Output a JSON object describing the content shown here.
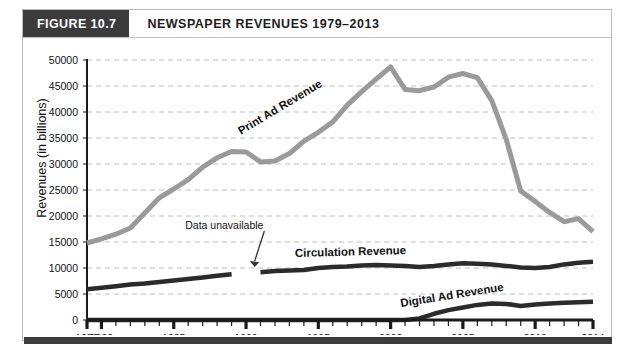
{
  "figure": {
    "tag": "FIGURE 10.7",
    "title": "NEWSPAPER REVENUES 1979–2013"
  },
  "axes": {
    "y_title": "Revenues (in billions)",
    "y_ticks": [
      "0",
      "5000",
      "10000",
      "15000",
      "20000",
      "25000",
      "30000",
      "35000",
      "40000",
      "45000",
      "50000"
    ],
    "x_ticks": [
      "1979",
      "1980",
      "1985",
      "1990",
      "1995",
      "2000",
      "2005",
      "2010",
      "2014"
    ]
  },
  "annotations": {
    "data_unavailable": "Data unavailable"
  },
  "series_labels": {
    "print": "Print Ad Revenue",
    "circulation": "Circulation Revenue",
    "digital": "Digital Ad Revenue"
  },
  "colors": {
    "print": "#9a9a9a",
    "circulation": "#2b2b2b",
    "digital": "#2b2b2b",
    "grid": "#c0c0c0",
    "axis": "#1a1a1a",
    "header_tag_bg": "#3b3b3b",
    "frame": "#b9b9b9"
  },
  "chart_data": {
    "type": "line",
    "title": "NEWSPAPER REVENUES 1979–2013",
    "xlabel": "",
    "ylabel": "Revenues (in billions)",
    "xlim": [
      1979,
      2014
    ],
    "ylim": [
      0,
      50000
    ],
    "grid": true,
    "legend": "inline-labels",
    "x": [
      1979,
      1980,
      1981,
      1982,
      1983,
      1984,
      1985,
      1986,
      1987,
      1988,
      1989,
      1990,
      1991,
      1992,
      1993,
      1994,
      1995,
      1996,
      1997,
      1998,
      1999,
      2000,
      2001,
      2002,
      2003,
      2004,
      2005,
      2006,
      2007,
      2008,
      2009,
      2010,
      2011,
      2012,
      2013,
      2014
    ],
    "series": [
      {
        "name": "Print Ad Revenue",
        "color": "#9a9a9a",
        "values": [
          14800,
          15600,
          16500,
          17700,
          20600,
          23500,
          25200,
          27000,
          29400,
          31200,
          32400,
          32300,
          30400,
          30600,
          32000,
          34400,
          36100,
          38100,
          41300,
          43900,
          46300,
          48700,
          44300,
          44100,
          44800,
          46700,
          47400,
          46600,
          42200,
          34700,
          24800,
          22800,
          20700,
          18900,
          19500,
          17000
        ]
      },
      {
        "name": "Circulation Revenue",
        "color": "#2b2b2b",
        "gap": [
          1990,
          1991
        ],
        "values": [
          5900,
          6200,
          6500,
          6800,
          7000,
          7300,
          7600,
          7900,
          8200,
          8500,
          8800,
          null,
          9200,
          9400,
          9500,
          9600,
          10000,
          10200,
          10300,
          10500,
          10600,
          10500,
          10400,
          10200,
          10400,
          10700,
          10900,
          10800,
          10700,
          10400,
          10100,
          10000,
          10200,
          10700,
          11000,
          11200
        ]
      },
      {
        "name": "Digital Ad Revenue",
        "color": "#2b2b2b",
        "values": [
          0,
          0,
          0,
          0,
          0,
          0,
          0,
          0,
          0,
          0,
          0,
          0,
          0,
          0,
          0,
          0,
          0,
          0,
          0,
          0,
          0,
          0,
          0,
          300,
          1200,
          1900,
          2400,
          2900,
          3200,
          3100,
          2700,
          3000,
          3200,
          3300,
          3400,
          3500
        ]
      }
    ],
    "annotations": [
      {
        "text": "Data unavailable",
        "x": 1988.5,
        "y": 17500,
        "points_to": {
          "x": 1990.6,
          "y": 10200
        }
      }
    ]
  }
}
